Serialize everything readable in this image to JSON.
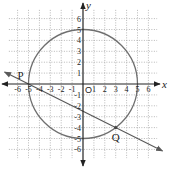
{
  "diagram": {
    "type": "coordinate-geometry",
    "axes": {
      "x_label": "x",
      "y_label": "y",
      "origin_label": "O",
      "x_ticks": [
        "-6",
        "-5",
        "-4",
        "-3",
        "-2",
        "-1",
        "1",
        "2",
        "3",
        "4",
        "5",
        "6"
      ],
      "y_ticks": [
        "6",
        "5",
        "4",
        "3",
        "2",
        "1",
        "-1",
        "-2",
        "-3",
        "-4",
        "-5",
        "-6"
      ],
      "range": {
        "xmin": -7,
        "xmax": 7,
        "ymin": -7,
        "ymax": 7
      }
    },
    "grid": {
      "style": "dotted",
      "spacing": 1
    },
    "circle": {
      "center": [
        0,
        0
      ],
      "radius": 5
    },
    "line": {
      "through": [
        [
          -5,
          0
        ],
        [
          3,
          -4
        ]
      ],
      "slope": -0.5,
      "arrows": "both"
    },
    "points": [
      {
        "label": "P",
        "x": -5,
        "y": 0
      },
      {
        "label": "Q",
        "x": 3,
        "y": -4
      }
    ],
    "colors": {
      "axis": "#222222",
      "grid": "#9a9a9a",
      "circle": "#6f6f6f",
      "line": "#5a5a5a"
    }
  }
}
